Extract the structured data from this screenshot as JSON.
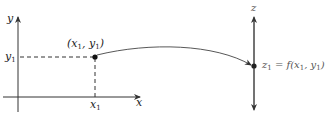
{
  "diagram": {
    "left_axes": {
      "y_axis_label": "y",
      "x_axis_label": "x",
      "y_tick_label": "y",
      "y_tick_sub": "1",
      "x_tick_label": "x",
      "x_tick_sub": "1"
    },
    "point": {
      "label_open": "(x",
      "label_sub1": "1",
      "label_mid": ", y",
      "label_sub2": "1",
      "label_close": ")"
    },
    "right_axis": {
      "z_axis_label": "z",
      "z_point_label_z": "z",
      "z_point_sub": "1",
      "z_point_eq": " = f(x",
      "z_point_sub2": "1",
      "z_point_mid": ", y",
      "z_point_sub3": "1",
      "z_point_close": ")"
    },
    "colors": {
      "axis": "#333333",
      "dash": "#333333",
      "point": "#111111",
      "curve": "#444444"
    }
  }
}
